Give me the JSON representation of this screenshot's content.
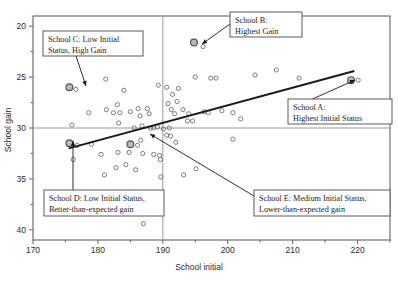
{
  "chart_data": {
    "type": "scatter",
    "title": "",
    "xlabel": "School initial",
    "ylabel": "School gain",
    "xlim": [
      170,
      225
    ],
    "ylim": [
      19,
      41
    ],
    "xticks": [
      170,
      180,
      190,
      200,
      210,
      220
    ],
    "yticks": [
      20,
      25,
      30,
      35,
      40
    ],
    "x_minor_step": 5,
    "y_minor_step": 2.5,
    "grid": false,
    "legend": "none",
    "reference_lines": [
      {
        "name": "mean-gain-line",
        "orientation": "horizontal",
        "value": 30,
        "color": "#9a9a9a"
      },
      {
        "name": "mean-initial-line",
        "orientation": "vertical",
        "value": 190,
        "color": "#9a9a9a"
      }
    ],
    "regression_line": {
      "name": "regression-line",
      "x": [
        175.5,
        219.5
      ],
      "y": [
        28.0,
        35.6
      ],
      "color": "#1a1a1a"
    },
    "points": [
      {
        "x": 175.6,
        "y": 34.0,
        "highlight": true,
        "label": "School C"
      },
      {
        "x": 194.8,
        "y": 38.4,
        "highlight": true,
        "label": "School B"
      },
      {
        "x": 219.0,
        "y": 34.7,
        "highlight": true,
        "label": "School A"
      },
      {
        "x": 175.6,
        "y": 28.5,
        "highlight": true,
        "label": "School D"
      },
      {
        "x": 185.0,
        "y": 28.4,
        "highlight": true,
        "label": "School E"
      },
      {
        "x": 176.6,
        "y": 33.8
      },
      {
        "x": 196.2,
        "y": 38.0
      },
      {
        "x": 220.1,
        "y": 34.7
      },
      {
        "x": 176.8,
        "y": 28.3
      },
      {
        "x": 186.1,
        "y": 28.3
      },
      {
        "x": 181.2,
        "y": 34.8
      },
      {
        "x": 184.0,
        "y": 33.7
      },
      {
        "x": 189.3,
        "y": 34.2
      },
      {
        "x": 190.6,
        "y": 34.0
      },
      {
        "x": 191.5,
        "y": 33.3
      },
      {
        "x": 192.4,
        "y": 33.9
      },
      {
        "x": 195.0,
        "y": 35.0
      },
      {
        "x": 197.4,
        "y": 34.9
      },
      {
        "x": 198.2,
        "y": 34.9
      },
      {
        "x": 204.2,
        "y": 35.2
      },
      {
        "x": 207.5,
        "y": 35.7
      },
      {
        "x": 211.0,
        "y": 34.9
      },
      {
        "x": 178.6,
        "y": 31.5
      },
      {
        "x": 181.3,
        "y": 31.8
      },
      {
        "x": 182.4,
        "y": 31.5
      },
      {
        "x": 183.4,
        "y": 31.5
      },
      {
        "x": 183.0,
        "y": 32.3
      },
      {
        "x": 185.0,
        "y": 31.6
      },
      {
        "x": 186.2,
        "y": 31.9
      },
      {
        "x": 186.5,
        "y": 31.2
      },
      {
        "x": 187.6,
        "y": 31.9
      },
      {
        "x": 187.9,
        "y": 31.4
      },
      {
        "x": 190.8,
        "y": 32.4
      },
      {
        "x": 191.3,
        "y": 31.8
      },
      {
        "x": 191.8,
        "y": 31.4
      },
      {
        "x": 192.2,
        "y": 32.6
      },
      {
        "x": 193.1,
        "y": 31.8
      },
      {
        "x": 194.0,
        "y": 31.4
      },
      {
        "x": 196.4,
        "y": 31.6
      },
      {
        "x": 197.0,
        "y": 31.5
      },
      {
        "x": 199.1,
        "y": 31.7
      },
      {
        "x": 200.8,
        "y": 31.5
      },
      {
        "x": 176.0,
        "y": 30.3
      },
      {
        "x": 183.2,
        "y": 30.5
      },
      {
        "x": 185.6,
        "y": 30.0
      },
      {
        "x": 186.8,
        "y": 30.2
      },
      {
        "x": 188.1,
        "y": 30.0
      },
      {
        "x": 188.6,
        "y": 30.0
      },
      {
        "x": 189.2,
        "y": 30.1
      },
      {
        "x": 190.1,
        "y": 29.9
      },
      {
        "x": 191.0,
        "y": 30.0
      },
      {
        "x": 193.8,
        "y": 30.7
      },
      {
        "x": 194.6,
        "y": 30.7
      },
      {
        "x": 202.0,
        "y": 30.9
      },
      {
        "x": 179.0,
        "y": 28.4
      },
      {
        "x": 186.6,
        "y": 28.8
      },
      {
        "x": 190.6,
        "y": 29.3
      },
      {
        "x": 191.2,
        "y": 29.2
      },
      {
        "x": 192.0,
        "y": 28.6
      },
      {
        "x": 200.8,
        "y": 28.9
      },
      {
        "x": 176.2,
        "y": 26.9
      },
      {
        "x": 180.5,
        "y": 27.4
      },
      {
        "x": 181.0,
        "y": 25.4
      },
      {
        "x": 182.8,
        "y": 26.1
      },
      {
        "x": 183.1,
        "y": 27.6
      },
      {
        "x": 184.3,
        "y": 26.4
      },
      {
        "x": 184.8,
        "y": 27.6
      },
      {
        "x": 185.8,
        "y": 25.9
      },
      {
        "x": 186.9,
        "y": 27.5
      },
      {
        "x": 188.6,
        "y": 27.4
      },
      {
        "x": 189.5,
        "y": 27.3
      },
      {
        "x": 189.6,
        "y": 26.9
      },
      {
        "x": 189.7,
        "y": 25.2
      },
      {
        "x": 193.2,
        "y": 25.4
      },
      {
        "x": 195.1,
        "y": 26.0
      },
      {
        "x": 187.0,
        "y": 20.6
      }
    ],
    "callouts": [
      {
        "name": "callout-school-c",
        "lines": [
          "School C: Low Initial",
          "Status, High Gain"
        ],
        "box": {
          "x": 43,
          "y": 31,
          "w": 100,
          "h": 25
        },
        "leader": [
          [
            76,
            56
          ],
          [
            86,
            86
          ]
        ]
      },
      {
        "name": "callout-school-b",
        "lines": [
          "School B:",
          "Highest Gain"
        ],
        "box": {
          "x": 230,
          "y": 12,
          "w": 72,
          "h": 25
        },
        "leader": [
          [
            230,
            24
          ],
          [
            202,
            44
          ]
        ]
      },
      {
        "name": "callout-school-a",
        "lines": [
          "School A:",
          "Highest Initial Status"
        ],
        "box": {
          "x": 288,
          "y": 99,
          "w": 104,
          "h": 25
        },
        "leader": [
          [
            288,
            110
          ],
          [
            355,
            80
          ]
        ]
      },
      {
        "name": "callout-school-d",
        "lines": [
          "School D: Low Initial Status,",
          "Better-than-expected gain"
        ],
        "box": {
          "x": 44,
          "y": 190,
          "w": 120,
          "h": 26
        },
        "leader": [
          [
            73,
            190
          ],
          [
            73,
            141
          ]
        ]
      },
      {
        "name": "callout-school-e",
        "lines": [
          "School E: Medium Initial Status,",
          "Lower-than-expected gain"
        ],
        "box": {
          "x": 254,
          "y": 190,
          "w": 136,
          "h": 26
        },
        "leader": [
          [
            254,
            196
          ],
          [
            150,
            134
          ]
        ]
      }
    ]
  },
  "axes": {
    "x_title": "School initial",
    "y_title": "School gain",
    "x_tick_labels": [
      "170",
      "180",
      "190",
      "200",
      "210",
      "220"
    ],
    "y_tick_labels": [
      "40",
      "35",
      "30",
      "25",
      "20"
    ]
  },
  "colors": {
    "frame": "#555555",
    "reference": "#9a9a9a",
    "regression": "#1a1a1a",
    "point_stroke": "#6e6e6e",
    "highlight_stroke": "#555555",
    "highlight_fill": "#b9b9b9",
    "callout_border": "#4a4a4a",
    "text": "#1b1b1b"
  }
}
